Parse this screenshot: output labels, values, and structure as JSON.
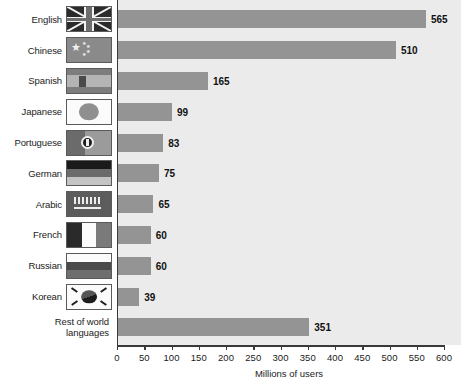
{
  "chart_data": {
    "type": "bar",
    "orientation": "horizontal",
    "title": "",
    "xlabel": "Millions of users",
    "ylabel": "",
    "xlim": [
      0,
      600
    ],
    "xticks": [
      0,
      50,
      100,
      150,
      200,
      250,
      300,
      350,
      400,
      450,
      500,
      550,
      600
    ],
    "grid": false,
    "legend": null,
    "categories": [
      "English",
      "Chinese",
      "Spanish",
      "Japanese",
      "Portuguese",
      "German",
      "Arabic",
      "French",
      "Russian",
      "Korean",
      "Rest of world\nlanguages"
    ],
    "values": [
      565,
      510,
      165,
      99,
      83,
      75,
      65,
      60,
      60,
      39,
      351
    ],
    "value_labels": [
      "565",
      "510",
      "165",
      "99",
      "83",
      "75",
      "65",
      "60",
      "60",
      "39",
      "351"
    ],
    "flags": [
      "uk",
      "cn",
      "es",
      "jp",
      "pt",
      "de",
      "sa",
      "fr",
      "ru",
      "kr",
      "none"
    ],
    "flag_names": [
      "flag-united-kingdom-icon",
      "flag-china-icon",
      "flag-spain-icon",
      "flag-japan-icon",
      "flag-portugal-icon",
      "flag-germany-icon",
      "flag-saudi-arabia-icon",
      "flag-france-icon",
      "flag-russia-icon",
      "flag-south-korea-icon",
      "no-flag"
    ],
    "colors": {
      "bar": "#949494",
      "plot_background": "#ebebeb",
      "axis": "#3a3a3a",
      "text": "#1b1b1b",
      "page_background": "#ffffff"
    }
  }
}
